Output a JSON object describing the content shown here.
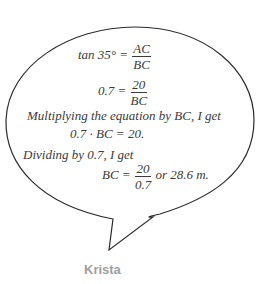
{
  "speaker": {
    "name": "Krista",
    "color": "#a0a0a0"
  },
  "lines": {
    "eq1": {
      "lhs": "tan 35° =",
      "num": "AC",
      "den": "BC"
    },
    "eq2": {
      "lhs": "0.7 =",
      "num": "20",
      "den": "BC"
    },
    "text1": "Multiplying the equation by BC, I get",
    "eq3": "0.7 · BC = 20.",
    "text2": "Dividing by 0.7, I get",
    "eq4": {
      "lhs": "BC =",
      "num": "20",
      "den": "0.7",
      "rhs": "or 28.6 m."
    }
  },
  "colors": {
    "stroke": "#2a2a2a",
    "text": "#3a3a3a"
  }
}
